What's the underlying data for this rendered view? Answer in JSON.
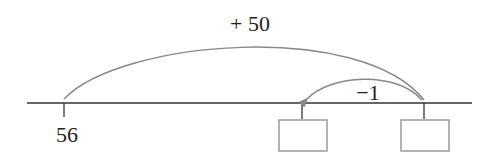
{
  "diagram": {
    "type": "number-line",
    "start_label": "56",
    "jumps": [
      {
        "label": "+ 50",
        "from": "56",
        "to": "box-right",
        "direction": "forward"
      },
      {
        "label": "−1",
        "from": "box-right",
        "to": "box-left",
        "direction": "backward"
      }
    ],
    "answer_boxes": [
      {
        "id": "box-left",
        "value": ""
      },
      {
        "id": "box-right",
        "value": ""
      }
    ],
    "colors": {
      "line": "#333333",
      "arc": "#888888",
      "box": "#9a9a9a"
    }
  }
}
